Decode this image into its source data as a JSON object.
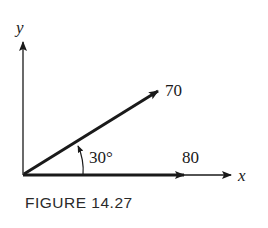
{
  "figure": {
    "caption": "FIGURE 14.27",
    "axes": {
      "x_label": "x",
      "y_label": "y"
    },
    "vectors": [
      {
        "name": "force-70",
        "magnitude_label": "70",
        "angle_deg": 30
      },
      {
        "name": "force-80",
        "magnitude_label": "80",
        "angle_deg": 0
      }
    ],
    "angle_label": "30°",
    "colors": {
      "ink": "#1a1a1a",
      "background": "#ffffff"
    }
  }
}
